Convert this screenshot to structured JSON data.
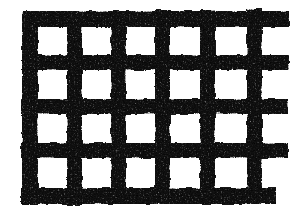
{
  "image": {
    "title": "Woven Mesh Grid",
    "kind": "grid-lattice-texture",
    "medium": "scanned monochrome print",
    "width": 300,
    "height": 212,
    "background_color": "#ffffff",
    "ink_color": "#121212",
    "description": "Coarse black woven lattice / mesh of thick horizontal and vertical bands forming a field of white square openings, cropped at the right edge.",
    "texture": {
      "style": "grainy-speckled-ink",
      "edge_quality": "irregular-wobbly",
      "speckle_density": 0.5,
      "speckle_color": "#000000",
      "highlight_color": "#ffffff"
    }
  },
  "grid": {
    "rows": 4,
    "columns": 5,
    "cell_count": 20,
    "cell_color": "#ffffff",
    "bar_color": "#121212",
    "vertical_bars": [
      {
        "name": "v-bar-1",
        "x": 22,
        "width": 16,
        "y_top": 11,
        "y_bottom": 205
      },
      {
        "name": "v-bar-2",
        "x": 67,
        "width": 15,
        "y_top": 11,
        "y_bottom": 205
      },
      {
        "name": "v-bar-3",
        "x": 111,
        "width": 15,
        "y_top": 11,
        "y_bottom": 204
      },
      {
        "name": "v-bar-4",
        "x": 155,
        "width": 15,
        "y_top": 10,
        "y_bottom": 204
      },
      {
        "name": "v-bar-5",
        "x": 200,
        "width": 15,
        "y_top": 10,
        "y_bottom": 203
      },
      {
        "name": "v-bar-6",
        "x": 247,
        "width": 15,
        "y_top": 9,
        "y_bottom": 203
      }
    ],
    "horizontal_bars": [
      {
        "name": "h-bar-1",
        "y": 11,
        "height": 16,
        "x_left": 22,
        "x_right": 289
      },
      {
        "name": "h-bar-2",
        "y": 55,
        "height": 15,
        "x_left": 22,
        "x_right": 289
      },
      {
        "name": "h-bar-3",
        "y": 99,
        "height": 15,
        "x_left": 21,
        "x_right": 288
      },
      {
        "name": "h-bar-4",
        "y": 143,
        "height": 15,
        "x_left": 21,
        "x_right": 288
      },
      {
        "name": "h-bar-5",
        "y": 188,
        "height": 16,
        "x_left": 21,
        "x_right": 276
      }
    ],
    "cells": [
      {
        "row": 1,
        "col": 1,
        "x": 38,
        "y": 27,
        "w": 29,
        "h": 28
      },
      {
        "row": 1,
        "col": 2,
        "x": 82,
        "y": 27,
        "w": 29,
        "h": 28
      },
      {
        "row": 1,
        "col": 3,
        "x": 126,
        "y": 26,
        "w": 29,
        "h": 29
      },
      {
        "row": 1,
        "col": 4,
        "x": 170,
        "y": 26,
        "w": 30,
        "h": 29
      },
      {
        "row": 1,
        "col": 5,
        "x": 215,
        "y": 25,
        "w": 32,
        "h": 30
      },
      {
        "row": 2,
        "col": 1,
        "x": 38,
        "y": 70,
        "w": 29,
        "h": 29
      },
      {
        "row": 2,
        "col": 2,
        "x": 82,
        "y": 70,
        "w": 29,
        "h": 29
      },
      {
        "row": 2,
        "col": 3,
        "x": 126,
        "y": 70,
        "w": 29,
        "h": 29
      },
      {
        "row": 2,
        "col": 4,
        "x": 170,
        "y": 70,
        "w": 30,
        "h": 29
      },
      {
        "row": 2,
        "col": 5,
        "x": 215,
        "y": 69,
        "w": 32,
        "h": 30
      },
      {
        "row": 3,
        "col": 1,
        "x": 37,
        "y": 114,
        "w": 30,
        "h": 29
      },
      {
        "row": 3,
        "col": 2,
        "x": 82,
        "y": 114,
        "w": 29,
        "h": 29
      },
      {
        "row": 3,
        "col": 3,
        "x": 126,
        "y": 114,
        "w": 29,
        "h": 29
      },
      {
        "row": 3,
        "col": 4,
        "x": 170,
        "y": 114,
        "w": 30,
        "h": 29
      },
      {
        "row": 3,
        "col": 5,
        "x": 215,
        "y": 113,
        "w": 32,
        "h": 30
      },
      {
        "row": 4,
        "col": 1,
        "x": 37,
        "y": 158,
        "w": 30,
        "h": 30
      },
      {
        "row": 4,
        "col": 2,
        "x": 82,
        "y": 158,
        "w": 29,
        "h": 30
      },
      {
        "row": 4,
        "col": 3,
        "x": 126,
        "y": 158,
        "w": 29,
        "h": 30
      },
      {
        "row": 4,
        "col": 4,
        "x": 170,
        "y": 158,
        "w": 30,
        "h": 30
      },
      {
        "row": 4,
        "col": 5,
        "x": 215,
        "y": 158,
        "w": 32,
        "h": 30
      }
    ],
    "open_right_margin": {
      "name": "cropped-right-column",
      "note": "Grid is cut off at the right edge; horizontal bands continue past the last vertical bar leaving open white gaps.",
      "gaps": [
        {
          "x": 262,
          "y": 27,
          "w": 27,
          "h": 28
        },
        {
          "x": 262,
          "y": 70,
          "w": 27,
          "h": 29
        },
        {
          "x": 262,
          "y": 114,
          "w": 27,
          "h": 29
        },
        {
          "x": 262,
          "y": 158,
          "w": 27,
          "h": 30
        }
      ]
    }
  }
}
